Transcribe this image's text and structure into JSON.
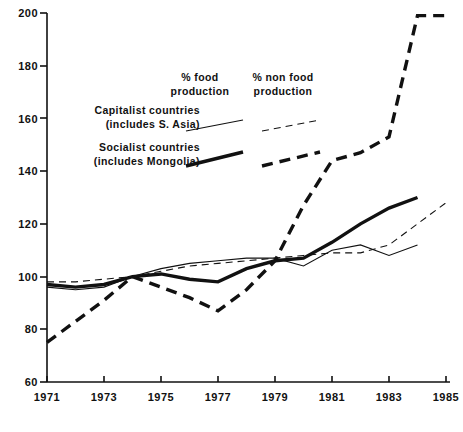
{
  "chart_data": {
    "type": "line",
    "title": "",
    "subtitle": "",
    "xlabel": "",
    "ylabel": "",
    "xlim": [
      1971,
      1985
    ],
    "ylim": [
      60,
      200
    ],
    "grid": false,
    "legend_position": "upper-left-inside",
    "x_ticks": [
      1971,
      1973,
      1975,
      1977,
      1979,
      1981,
      1983,
      1985
    ],
    "y_ticks": [
      60,
      80,
      100,
      120,
      140,
      160,
      180,
      200
    ],
    "series": [
      {
        "name": "Capitalist countries (includes S. Asia) — % food production",
        "group": "Capitalist countries (includes S. Asia)",
        "measure": "% food production",
        "style": "thin-solid",
        "x": [
          1971,
          1972,
          1973,
          1974,
          1975,
          1976,
          1977,
          1978,
          1979,
          1980,
          1981,
          1982,
          1983,
          1984
        ],
        "values": [
          96,
          95,
          96,
          100,
          103,
          105,
          106,
          107,
          107,
          104,
          110,
          112,
          108,
          112
        ]
      },
      {
        "name": "Capitalist countries (includes S. Asia) — % non food production",
        "group": "Capitalist countries (includes S. Asia)",
        "measure": "% non food production",
        "style": "thin-dashed",
        "x": [
          1971,
          1972,
          1973,
          1974,
          1975,
          1976,
          1977,
          1978,
          1979,
          1980,
          1981,
          1982,
          1983,
          1985
        ],
        "values": [
          98,
          98,
          99,
          100,
          102,
          104,
          105,
          106,
          107,
          108,
          109,
          109,
          112,
          128
        ]
      },
      {
        "name": "Socialist countries (includes Mongolia) — % food production",
        "group": "Socialist countries (includes Mongolia)",
        "measure": "% food production",
        "style": "thick-solid",
        "x": [
          1971,
          1972,
          1973,
          1974,
          1975,
          1976,
          1977,
          1978,
          1979,
          1980,
          1981,
          1982,
          1983,
          1984
        ],
        "values": [
          97,
          96,
          97,
          100,
          101,
          99,
          98,
          103,
          106,
          107,
          113,
          120,
          126,
          130
        ]
      },
      {
        "name": "Socialist countries (includes Mongolia) — % non food production",
        "group": "Socialist countries (includes Mongolia)",
        "measure": "% non food production",
        "style": "thick-dashed",
        "x": [
          1971,
          1972,
          1973,
          1974,
          1975,
          1976,
          1977,
          1978,
          1979,
          1980,
          1981,
          1982,
          1983,
          1984,
          1985
        ],
        "values": [
          75,
          83,
          91,
          100,
          96,
          92,
          87,
          95,
          106,
          127,
          144,
          147,
          153,
          199,
          199
        ]
      }
    ]
  },
  "axis": {
    "y_labels": [
      "200",
      "180",
      "160",
      "140",
      "120",
      "100",
      "80",
      "60"
    ],
    "x_labels": [
      "1971",
      "1973",
      "1975",
      "1977",
      "1979",
      "1981",
      "1983",
      "1985"
    ]
  },
  "legend": {
    "measure_headers": [
      {
        "line1": "% food",
        "line2": "production"
      },
      {
        "line1": "% non food",
        "line2": "production"
      }
    ],
    "group_rows": [
      {
        "line1": "Capitalist countries",
        "line2": "(includes S. Asia)"
      },
      {
        "line1": "Socialist countries",
        "line2": "(includes Mongolia)"
      }
    ]
  },
  "caption": {
    "text": ""
  },
  "colors": {
    "ink": "#111111",
    "background": "#ffffff"
  }
}
